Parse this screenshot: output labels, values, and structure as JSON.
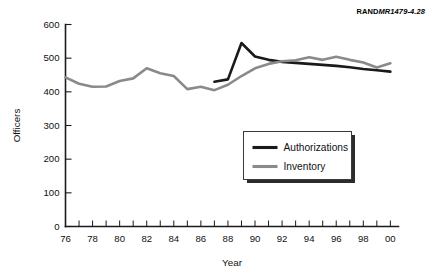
{
  "figure": {
    "source_tag_bold": "RAND",
    "source_tag_italic": "MR1479-4.28"
  },
  "chart_data": {
    "type": "line",
    "title": "",
    "xlabel": "Year",
    "ylabel": "Officers",
    "xlim": [
      1976,
      2000.6
    ],
    "ylim": [
      0,
      600
    ],
    "y_ticks": [
      0,
      100,
      200,
      300,
      400,
      500,
      600
    ],
    "y_tick_labels": [
      "0",
      "100",
      "200",
      "300",
      "400",
      "500",
      "600"
    ],
    "x_ticks": [
      1976,
      1977,
      1978,
      1979,
      1980,
      1981,
      1982,
      1983,
      1984,
      1985,
      1986,
      1987,
      1988,
      1989,
      1990,
      1991,
      1992,
      1993,
      1994,
      1995,
      1996,
      1997,
      1998,
      1999,
      2000
    ],
    "x_tick_labels_shown": [
      "76",
      "",
      "78",
      "",
      "80",
      "",
      "82",
      "",
      "84",
      "",
      "86",
      "",
      "88",
      "",
      "90",
      "",
      "92",
      "",
      "94",
      "",
      "96",
      "",
      "98",
      "",
      "00"
    ],
    "grid": false,
    "legend_position": "center-right",
    "series": [
      {
        "name": "Authorizations",
        "color": "#1a1a1a",
        "width": 2.6,
        "x": [
          1987,
          1988,
          1989,
          1990,
          1991,
          1992,
          1993,
          1994,
          1995,
          1996,
          1997,
          1998,
          1999,
          2000
        ],
        "values": [
          430,
          437,
          545,
          505,
          495,
          489,
          486,
          483,
          480,
          477,
          473,
          468,
          464,
          460
        ]
      },
      {
        "name": "Inventory",
        "color": "#8a8a8a",
        "width": 2.6,
        "x": [
          1976,
          1977,
          1978,
          1979,
          1980,
          1981,
          1982,
          1983,
          1984,
          1985,
          1986,
          1987,
          1988,
          1989,
          1990,
          1991,
          1992,
          1993,
          1994,
          1995,
          1996,
          1997,
          1998,
          1999,
          2000
        ],
        "values": [
          443,
          424,
          415,
          416,
          432,
          440,
          470,
          455,
          447,
          408,
          415,
          405,
          421,
          447,
          470,
          483,
          491,
          494,
          503,
          495,
          504,
          495,
          487,
          472,
          485
        ]
      }
    ],
    "legend_entries": [
      {
        "label": "Authorizations",
        "color": "#1a1a1a"
      },
      {
        "label": "Inventory",
        "color": "#8a8a8a"
      }
    ]
  }
}
